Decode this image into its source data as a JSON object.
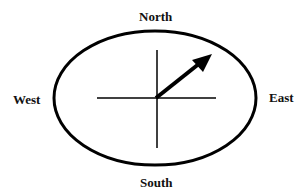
{
  "labels": {
    "north": "North",
    "south": "South",
    "east": "East",
    "west": "West"
  },
  "diagram": {
    "type": "compass",
    "arrow_direction": "north-east",
    "stroke_color": "#000000",
    "background": "#ffffff"
  }
}
